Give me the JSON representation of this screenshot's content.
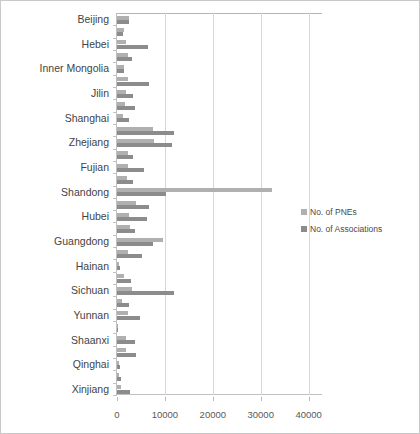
{
  "chart_data": {
    "type": "bar",
    "orientation": "horizontal",
    "title": "",
    "xlabel": "",
    "ylabel": "",
    "xlim": [
      0,
      43000
    ],
    "xticks": [
      0,
      10000,
      20000,
      30000,
      40000
    ],
    "xtick_labels": [
      "0",
      "10000",
      "20000",
      "30000",
      "40000"
    ],
    "grid": true,
    "legend_position": "right",
    "categories": [
      "Beijing",
      "Tianjin",
      "Hebei",
      "Shanxi",
      "Inner Mongolia",
      "Liaoning",
      "Jilin",
      "Heilongjiang",
      "Shanghai",
      "Jiangsu",
      "Zhejiang",
      "Anhui",
      "Fujian",
      "Jiangxi",
      "Shandong",
      "Henan",
      "Hubei",
      "Hunan",
      "Guangdong",
      "Guangxi",
      "Hainan",
      "Chongqing",
      "Sichuan",
      "Guizhou",
      "Yunnan",
      "Tibet",
      "Shaanxi",
      "Gansu",
      "Qinghai",
      "Ningxia",
      "Xinjiang"
    ],
    "visible_tick_labels": [
      "Beijing",
      "Hebei",
      "Inner Mongolia",
      "Jilin",
      "Shanghai",
      "Zhejiang",
      "Fujian",
      "Shandong",
      "Hubei",
      "Guangdong",
      "Hainan",
      "Sichuan",
      "Yunnan",
      "Shaanxi",
      "Qinghai",
      "Xinjiang"
    ],
    "series": [
      {
        "name": "No. of PNEs",
        "color": "#b0b0b0",
        "values": [
          2600,
          1500,
          1800,
          2300,
          1400,
          2200,
          1900,
          1700,
          1300,
          7600,
          7700,
          2300,
          2400,
          2100,
          32300,
          4000,
          2600,
          2800,
          9600,
          2300,
          400,
          1400,
          3100,
          1100,
          2300,
          200,
          1900,
          1800,
          400,
          400,
          900
        ]
      },
      {
        "name": "No. of Associations",
        "color": "#8c8c8c",
        "values": [
          2500,
          1200,
          6500,
          3200,
          1500,
          6600,
          3300,
          3800,
          2600,
          11800,
          11500,
          3300,
          5600,
          3400,
          10300,
          6700,
          6300,
          3800,
          7600,
          5300,
          600,
          3000,
          11900,
          2600,
          4800,
          200,
          3700,
          4000,
          700,
          900,
          2700
        ]
      }
    ],
    "legend": [
      "No. of PNEs",
      "No. of Associations"
    ]
  }
}
